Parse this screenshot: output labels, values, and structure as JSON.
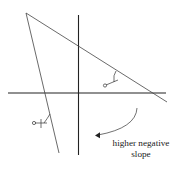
{
  "diagram": {
    "caption_line1": "higher negative",
    "caption_line2": "slope",
    "angle_label_shallow": "α",
    "angle_label_steep": "α",
    "elements": {
      "x_axis": "horizontal axis",
      "y_axis": "vertical axis",
      "shallow_line": "line with moderate negative slope",
      "steep_line": "line with higher negative slope",
      "arrow": "curved arrow pointing from shallow line toward steep line"
    },
    "colors": {
      "axis": "#222222",
      "line": "#444444",
      "background": "#ffffff"
    }
  }
}
